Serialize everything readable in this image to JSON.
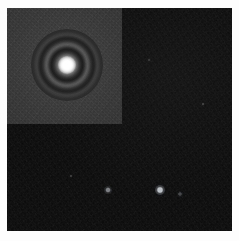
{
  "figure": {
    "width": 239,
    "height": 241,
    "background_color": "#fdfdfd"
  },
  "science_frame": {
    "name": "dark-sky-field",
    "description": "Dark astronomical background field with detector noise",
    "x": 7,
    "y": 8,
    "width": 225,
    "height": 223,
    "background_color": "#070707",
    "noise_level": "low"
  },
  "inset_panel": {
    "name": "psf-zoom-inset",
    "description": "Brighter zoomed cut-out panel in the upper-left quadrant showing a point-spread function",
    "x": 0,
    "y": 0,
    "width": 115,
    "height": 116,
    "background_color": "#343434",
    "corner": "top-left"
  },
  "psf": {
    "name": "airy-disk",
    "description": "Saturated stellar core surrounded by concentric Airy diffraction rings",
    "center_x": 60,
    "center_y": 57,
    "core_diameter": 14,
    "pattern_diameter": 72,
    "core_color": "#ffffff",
    "ring_dark_color": "#1e1e1e",
    "ring_bright_color": "#585858"
  },
  "point_sources": [
    {
      "name": "faint-source-a",
      "x": 101,
      "y": 182,
      "size": 2.4,
      "brightness": 0.55,
      "color": "#cfd6e0"
    },
    {
      "name": "faint-source-b",
      "x": 153,
      "y": 182,
      "size": 3.0,
      "brightness": 0.8,
      "color": "#e6ecf3"
    },
    {
      "name": "faint-source-c",
      "x": 173,
      "y": 186,
      "size": 1.6,
      "brightness": 0.3,
      "color": "#b8c0cc"
    },
    {
      "name": "faint-source-d",
      "x": 64,
      "y": 168,
      "size": 1.4,
      "brightness": 0.22,
      "color": "#aab2bd"
    },
    {
      "name": "faint-source-e",
      "x": 196,
      "y": 96,
      "size": 1.5,
      "brightness": 0.25,
      "color": "#aeb6c2"
    },
    {
      "name": "faint-source-f",
      "x": 142,
      "y": 52,
      "size": 1.3,
      "brightness": 0.2,
      "color": "#a6aeba"
    }
  ]
}
